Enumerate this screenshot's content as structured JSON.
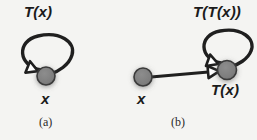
{
  "figure": {
    "background_color": "#f4f4f2",
    "node_fill_color": "#808080",
    "node_stroke_color": "#2b2b2b",
    "edge_color": "#1f1f1f",
    "arrowhead_fill_color": "#ffffff",
    "panels": [
      {
        "id": "a",
        "caption": "(a)",
        "loop_label": "T(x)",
        "node_label": "x",
        "nodes": [
          {
            "name": "x",
            "label": "x",
            "cx": 46,
            "cy": 76,
            "r": 9
          }
        ],
        "edges": [
          {
            "name": "self-loop",
            "from": "x",
            "to": "x",
            "label": "T(x)",
            "arrow": "hollow-triangle"
          }
        ]
      },
      {
        "id": "b",
        "caption": "(b)",
        "loop_label": "T(T(x))",
        "node_labels": [
          "x",
          "T(x)"
        ],
        "nodes": [
          {
            "name": "x",
            "label": "x",
            "cx": 143,
            "cy": 77,
            "r": 9
          },
          {
            "name": "tx",
            "label": "T(x)",
            "cx": 227,
            "cy": 70,
            "r": 9
          }
        ],
        "edges": [
          {
            "name": "x-to-tx",
            "from": "x",
            "to": "tx",
            "label": "",
            "arrow": "hollow-triangle"
          },
          {
            "name": "self-loop",
            "from": "tx",
            "to": "tx",
            "label": "T(T(x))",
            "arrow": "hollow-triangle"
          }
        ]
      }
    ]
  }
}
